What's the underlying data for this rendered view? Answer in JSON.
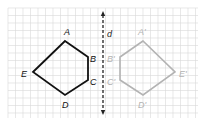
{
  "figure": {
    "type": "reflection-across-line",
    "grid": {
      "x0": 8,
      "y0": 8,
      "x1": 198,
      "y1": 118,
      "cell": 7.5,
      "color": "#d9d9d9"
    },
    "axis": {
      "label": "d",
      "x": 103,
      "y_top": 11,
      "y_bottom": 115,
      "color": "#222222"
    },
    "original": {
      "name": "ABCDE",
      "color": "#111111",
      "vertices": [
        {
          "label": "A",
          "x": 65,
          "y": 41,
          "lx": 64,
          "ly": 35
        },
        {
          "label": "B",
          "x": 88,
          "y": 57,
          "lx": 90,
          "ly": 62
        },
        {
          "label": "C",
          "x": 88,
          "y": 80,
          "lx": 90,
          "ly": 85
        },
        {
          "label": "D",
          "x": 65,
          "y": 95,
          "lx": 62,
          "ly": 108
        },
        {
          "label": "E",
          "x": 33,
          "y": 72,
          "lx": 21,
          "ly": 77
        }
      ]
    },
    "image": {
      "name": "A'B'C'D'E'",
      "color": "#b3b3b3",
      "vertices": [
        {
          "label": "A'",
          "x": 143,
          "y": 41,
          "lx": 138,
          "ly": 35
        },
        {
          "label": "B'",
          "x": 120,
          "y": 57,
          "lx": 107,
          "ly": 62
        },
        {
          "label": "C'",
          "x": 120,
          "y": 80,
          "lx": 107,
          "ly": 85
        },
        {
          "label": "D'",
          "x": 143,
          "y": 95,
          "lx": 138,
          "ly": 108
        },
        {
          "label": "E'",
          "x": 175,
          "y": 72,
          "lx": 179,
          "ly": 77
        }
      ]
    }
  }
}
